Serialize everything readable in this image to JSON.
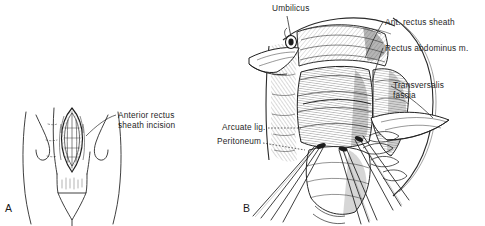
{
  "figure": {
    "background_color": "#ffffff",
    "ink_color": "#1f1f1f",
    "panels": [
      {
        "letter": "A",
        "name": "panel-a",
        "description": "Line drawing of lower abdomen showing anterior rectus sheath incision",
        "labels": [
          {
            "id": "anterior-rectus-sheath-incision",
            "line1": "Anterior rectus",
            "line2": "sheath incision"
          }
        ]
      },
      {
        "letter": "B",
        "name": "panel-b",
        "description": "Detailed surgical illustration of opened abdominal wall layers with retractors",
        "labels": [
          {
            "id": "umbilicus",
            "text": "Umbilicus"
          },
          {
            "id": "ant-rectus-sheath",
            "text": "Ant. rectus sheath"
          },
          {
            "id": "rectus-abdominus",
            "text": "Rectus abdominus m."
          },
          {
            "id": "transversalis-fascia",
            "line1": "Transversalis",
            "line2": "fascia"
          },
          {
            "id": "arcuate-ligament",
            "text": "Arcuate lig."
          },
          {
            "id": "peritoneum",
            "text": "Peritoneum"
          }
        ]
      }
    ]
  },
  "panel_a": {
    "letter": "A",
    "label_anterior_line1": "Anterior rectus",
    "label_anterior_line2": "sheath incision"
  },
  "panel_b": {
    "letter": "B",
    "label_umbilicus": "Umbilicus",
    "label_ant_rectus_sheath": "Ant. rectus sheath",
    "label_rectus_abdominus": "Rectus abdominus m.",
    "label_transversalis_line1": "Transversalis",
    "label_transversalis_line2": "fascia",
    "label_arcuate_lig": "Arcuate lig.",
    "label_peritoneum": "Peritoneum"
  }
}
